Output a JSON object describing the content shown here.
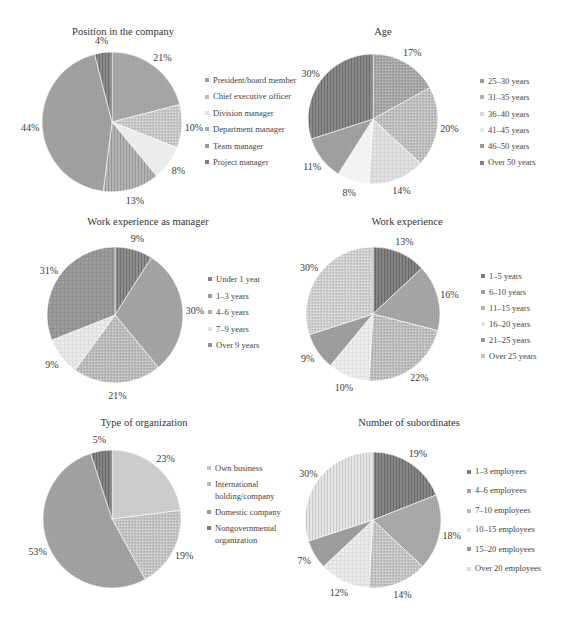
{
  "chart_data": [
    {
      "type": "pie",
      "title": "Position in the company",
      "categories": [
        "President/board member",
        "Chief executive officer",
        "Division manager",
        "Department manager",
        "Team manager",
        "Project manager"
      ],
      "values": [
        21,
        10,
        8,
        13,
        44,
        4
      ],
      "value_labels": [
        "21%",
        "10%",
        "8%",
        "13%",
        "44%",
        "4%"
      ],
      "unit": "%",
      "colors": [
        "#a9a9a9",
        "#c6c6c6",
        "#ececec",
        "#b4b4b4",
        "#a3a3a3",
        "#8a8a8a"
      ],
      "patterns": [
        "fine",
        "dots",
        "solid",
        "vstripes",
        "fine",
        "vstripes"
      ],
      "start": "12 o'clock, clockwise",
      "legend_position": "right"
    },
    {
      "type": "pie",
      "title": "Age",
      "categories": [
        "25–30 years",
        "31–35 years",
        "36–40 years",
        "41–45 years",
        "46–50 years",
        "Over 50 years"
      ],
      "values": [
        17,
        20,
        14,
        8,
        11,
        30
      ],
      "value_labels": [
        "17%",
        "20%",
        "14%",
        "8%",
        "11%",
        "30%"
      ],
      "unit": "%",
      "colors": [
        "#a6a6a6",
        "#bdbdbd",
        "#e2e2e2",
        "#f2f2f2",
        "#a2a2a2",
        "#8a8a8a"
      ],
      "patterns": [
        "dots",
        "dots",
        "grid",
        "solid",
        "fine",
        "vstripes"
      ],
      "start": "12 o'clock, clockwise",
      "legend_position": "right"
    },
    {
      "type": "pie",
      "title": "Work experience as manager",
      "categories": [
        "Under 1 year",
        "1–3 years",
        "4–6 years",
        "7–9 years",
        "Over 9 years"
      ],
      "values": [
        9,
        30,
        21,
        9,
        31
      ],
      "value_labels": [
        "9%",
        "30%",
        "21%",
        "9%",
        "31%"
      ],
      "unit": "%",
      "colors": [
        "#8e8e8e",
        "#a6a6a6",
        "#bababa",
        "#ebebeb",
        "#9c9c9c"
      ],
      "patterns": [
        "vstripes",
        "fine",
        "dots",
        "grid",
        "grid"
      ],
      "start": "12 o'clock, clockwise",
      "legend_position": "right"
    },
    {
      "type": "pie",
      "title": "Work experience",
      "categories": [
        "1–5 years",
        "6–10 years",
        "11–15 years",
        "16–20 years",
        "21–25 years",
        "Over 25 years"
      ],
      "values": [
        13,
        16,
        22,
        10,
        9,
        30
      ],
      "value_labels": [
        "13%",
        "16%",
        "22%",
        "10%",
        "9%",
        "30%"
      ],
      "unit": "%",
      "colors": [
        "#858585",
        "#a8a8a8",
        "#bcbcbc",
        "#eeeeee",
        "#a0a0a0",
        "#cdcdcd"
      ],
      "patterns": [
        "vstripes",
        "fine",
        "dots",
        "grid",
        "fine",
        "dots"
      ],
      "start": "12 o'clock, clockwise",
      "legend_position": "right"
    },
    {
      "type": "pie",
      "title": "Type of organization",
      "categories": [
        "Own business",
        "International holding/company",
        "Domestic company",
        "Nongovernmental organization"
      ],
      "values": [
        23,
        19,
        53,
        5
      ],
      "value_labels": [
        "23%",
        "19%",
        "53%",
        "5%"
      ],
      "unit": "%",
      "colors": [
        "#cfcfcf",
        "#c2c2c2",
        "#a4a4a4",
        "#858585"
      ],
      "patterns": [
        "fine",
        "dots",
        "fine",
        "vstripes"
      ],
      "start": "12 o'clock, clockwise",
      "legend_position": "right"
    },
    {
      "type": "pie",
      "title": "Number of subordinates",
      "categories": [
        "1–3 employees",
        "4–6 employees",
        "7–10 employees",
        "10–15 employees",
        "15–20 employees",
        "Over 20 employees"
      ],
      "values": [
        19,
        18,
        14,
        12,
        7,
        30
      ],
      "value_labels": [
        "19%",
        "18%",
        "14%",
        "12%",
        "7%",
        "30%"
      ],
      "unit": "%",
      "colors": [
        "#878787",
        "#ababab",
        "#c2c2c2",
        "#ececec",
        "#a0a0a0",
        "#e6e6e6"
      ],
      "patterns": [
        "vstripes",
        "fine",
        "dots",
        "grid",
        "fine",
        "vstripes"
      ],
      "start": "12 o'clock, clockwise",
      "legend_position": "right"
    }
  ]
}
